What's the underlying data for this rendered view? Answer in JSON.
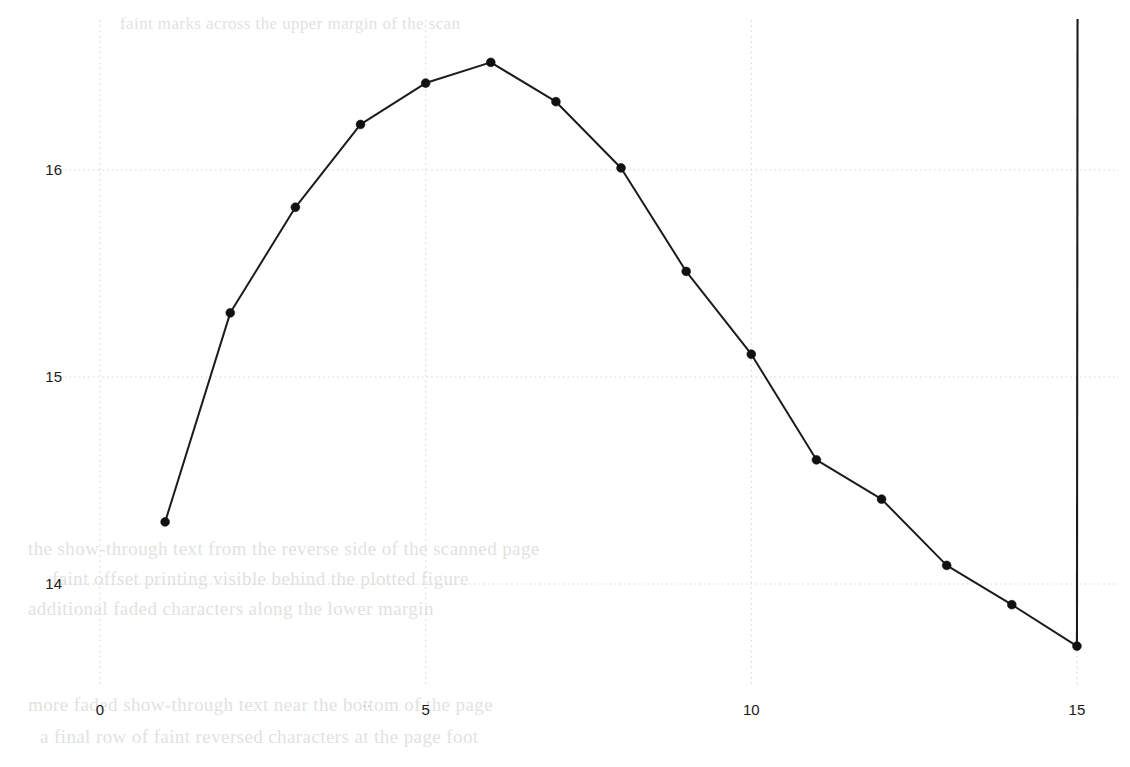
{
  "chart_data": {
    "type": "line",
    "title": "",
    "subtitle": "",
    "xlabel": "",
    "ylabel": "",
    "xlim": [
      0,
      15.45
    ],
    "ylim": [
      13.55,
      16.75
    ],
    "xticks": [
      0,
      5,
      10,
      15
    ],
    "yticks": [
      14,
      15,
      16
    ],
    "xtick_labels": [
      "0",
      "5",
      "10",
      "15"
    ],
    "ytick_labels": [
      "14",
      "15",
      "16"
    ],
    "grid": true,
    "grid_style": "dotted",
    "grid_color": "#d9d2d2",
    "legend": null,
    "legend_position": "none",
    "line_color": "#1c1c1c",
    "marker": "circle",
    "marker_color": "#111111",
    "series": [
      {
        "name": "series-1",
        "x": [
          1,
          2,
          3,
          4,
          5,
          6,
          7,
          8,
          9,
          10,
          11,
          12,
          13,
          14,
          15
        ],
        "values": [
          14.3,
          15.31,
          15.82,
          16.22,
          16.42,
          16.52,
          16.33,
          16.01,
          15.51,
          15.11,
          14.6,
          14.41,
          14.09,
          13.9,
          13.7
        ]
      }
    ],
    "annotations": [
      {
        "name": "vertical-line",
        "type": "vline",
        "x": 15,
        "y_from": 13.7,
        "y_to": 16.73
      },
      {
        "name": "ellipsis-mark",
        "type": "text",
        "text": "..",
        "x": 4.12,
        "y_px": 711
      }
    ]
  },
  "background_text": {
    "line1": "the show-through text from the reverse side of the scanned page",
    "line2": "faint offset printing visible behind the plotted figure",
    "line3": "additional faded characters along the lower margin",
    "line4": "more faded show-through text near the bottom of the page",
    "line5": "a final row of faint reversed characters at the page foot",
    "line6": "faint marks across the upper margin of the scan"
  }
}
